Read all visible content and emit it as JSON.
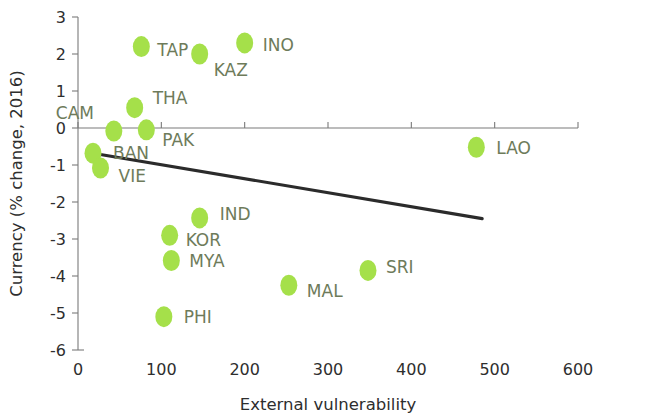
{
  "chart_data": {
    "type": "scatter",
    "title": "",
    "xlabel": "External vulnerability",
    "ylabel": "Currency (% change, 2016)",
    "xlim": [
      0,
      600
    ],
    "ylim": [
      -6,
      3
    ],
    "xticks": [
      0,
      100,
      200,
      300,
      400,
      500,
      600
    ],
    "yticks": [
      3,
      2,
      1,
      0,
      -1,
      -2,
      -3,
      -4,
      -5,
      -6
    ],
    "xtick_labels": [
      "0",
      "100",
      "200",
      "300",
      "400",
      "500",
      "600"
    ],
    "ytick_labels": [
      "3",
      "2",
      "1",
      "0",
      "-1",
      "-2",
      "-3",
      "-4",
      "-5",
      "-6"
    ],
    "grid": false,
    "zero_line": true,
    "legend": "none",
    "marker_color": "#a5e04a",
    "label_color": "#6e7b5a",
    "trendline_color": "#2b2b2b",
    "points": [
      {
        "label": "TAP",
        "x": 76,
        "y": 2.2,
        "lx": 16,
        "ly": 9
      },
      {
        "label": "KAZ",
        "x": 146,
        "y": 2.0,
        "lx": 14,
        "ly": 22
      },
      {
        "label": "INO",
        "x": 200,
        "y": 2.3,
        "lx": 18,
        "ly": 8
      },
      {
        "label": "THA",
        "x": 68,
        "y": 0.55,
        "lx": 18,
        "ly": -4
      },
      {
        "label": "CAM",
        "x": 43,
        "y": -0.08,
        "lx": -58,
        "ly": -12
      },
      {
        "label": "PAK",
        "x": 82,
        "y": -0.05,
        "lx": 16,
        "ly": 16
      },
      {
        "label": "BAN",
        "x": 18,
        "y": -0.68,
        "lx": 20,
        "ly": 6
      },
      {
        "label": "VIE",
        "x": 27,
        "y": -1.08,
        "lx": 18,
        "ly": 14
      },
      {
        "label": "IND",
        "x": 146,
        "y": -2.43,
        "lx": 20,
        "ly": 2
      },
      {
        "label": "KOR",
        "x": 110,
        "y": -2.9,
        "lx": 16,
        "ly": 11
      },
      {
        "label": "MYA",
        "x": 112,
        "y": -3.58,
        "lx": 18,
        "ly": 7
      },
      {
        "label": "MAL",
        "x": 253,
        "y": -4.25,
        "lx": 18,
        "ly": 12
      },
      {
        "label": "SRI",
        "x": 348,
        "y": -3.85,
        "lx": 18,
        "ly": 3
      },
      {
        "label": "PHI",
        "x": 103,
        "y": -5.1,
        "lx": 20,
        "ly": 6
      },
      {
        "label": "LAO",
        "x": 478,
        "y": -0.52,
        "lx": 20,
        "ly": 7
      }
    ],
    "trendline": {
      "x0": 18,
      "y0": -0.68,
      "x1": 485,
      "y1": -2.45
    }
  }
}
